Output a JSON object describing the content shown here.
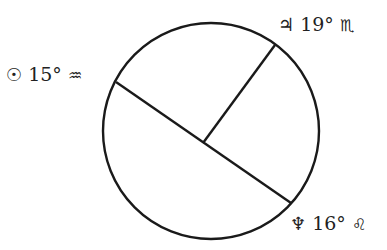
{
  "diagram": {
    "type": "astrological-aspect-circle",
    "circle": {
      "cx": 211,
      "cy": 131,
      "r": 108,
      "stroke": "#1a1a1a"
    },
    "lines": [
      {
        "name": "sun-neptune-line",
        "x1": 116,
        "y1": 82,
        "x2": 291,
        "y2": 203
      },
      {
        "name": "jupiter-line",
        "x1": 203,
        "y1": 143,
        "x2": 275,
        "y2": 45
      }
    ],
    "labels": [
      {
        "name": "sun-label",
        "planet_symbol": "☉",
        "degree": "15°",
        "sign_symbol": "♒",
        "planet": "Sun",
        "sign": "Aquarius"
      },
      {
        "name": "jupiter-label",
        "planet_symbol": "♃",
        "degree": "19°",
        "sign_symbol": "♏",
        "planet": "Jupiter",
        "sign": "Scorpio"
      },
      {
        "name": "neptune-label",
        "planet_symbol": "♆",
        "degree": "16°",
        "sign_symbol": "♌",
        "planet": "Neptune",
        "sign": "Leo"
      }
    ]
  }
}
